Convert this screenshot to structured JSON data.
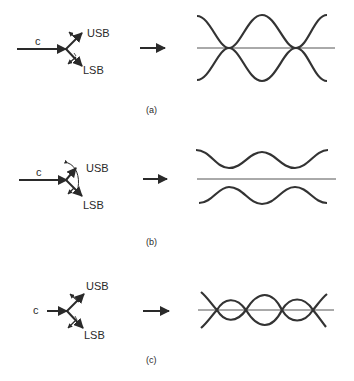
{
  "figure": {
    "panels": [
      {
        "id": "a",
        "caption": "(a)",
        "carrier_label": "c",
        "usb_label": "USB",
        "lsb_label": "LSB",
        "description": "Sidebands symmetric about carrier: envelope varies in amplitude (AM)"
      },
      {
        "id": "b",
        "caption": "(b)",
        "carrier_label": "c",
        "usb_label": "USB",
        "lsb_label": "LSB",
        "description": "Sidebands rotated: reduced-depth amplitude variation"
      },
      {
        "id": "c",
        "caption": "(c)",
        "carrier_label": "c",
        "usb_label": "USB",
        "lsb_label": "LSB",
        "description": "Reduced carrier: envelope crosses zero repeatedly"
      }
    ],
    "colors": {
      "ink": "#2a2a2a",
      "background": "#ffffff"
    }
  }
}
